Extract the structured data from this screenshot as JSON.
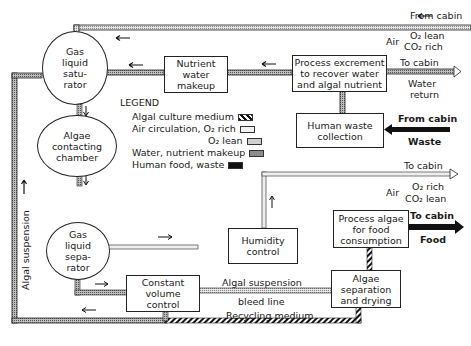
{
  "nodes": {
    "gas_liquid_saturator": "Gas liquid satu- rator",
    "gls_lines": [
      "Gas",
      "liquid",
      "satu-",
      "rator"
    ],
    "algae_contacting_chamber_lines": [
      "Algae",
      "contacting",
      "chamber"
    ],
    "gas_liquid_separator_lines": [
      "Gas",
      "liquid",
      "sepa-",
      "rator"
    ],
    "nutrient_water_makeup_lines": [
      "Nutrient",
      "water",
      "makeup"
    ],
    "process_excrement_lines": [
      "Process excrement",
      "to recover water",
      "and algal nutrient"
    ],
    "human_waste_collection_lines": [
      "Human waste",
      "collection"
    ],
    "humidity_control_lines": [
      "Humidity",
      "control"
    ],
    "process_algae_lines": [
      "Process algae",
      "for food",
      "consumption"
    ],
    "constant_volume_control_lines": [
      "Constant",
      "volume",
      "control"
    ],
    "algae_separation_lines": [
      "Algae",
      "separation",
      "and drying"
    ]
  },
  "labels": {
    "from_cabin_top": "From cabin",
    "air_top": "Air",
    "o2_lean_top": "O₂ lean",
    "co2_rich_top": "CO₂ rich",
    "to_cabin_water": "To cabin",
    "water_return": "Water",
    "water_return_2": "return",
    "from_cabin_waste": "From cabin",
    "waste": "Waste",
    "to_cabin_air": "To cabin",
    "air_mid": "Air",
    "o2_rich_mid": "O₂ rich",
    "co2_lean_mid": "CO₂ lean",
    "to_cabin_food": "To cabin",
    "food": "Food",
    "algal_suspension_side": "Algal suspension",
    "algal_suspension_bleed": "Algal suspension",
    "bleed_line": "bleed line",
    "recycling_medium": "Recycling medium"
  },
  "legend": {
    "title": "LEGEND",
    "items": [
      {
        "label": "Algal culture medium",
        "pattern": "hatched"
      },
      {
        "label": "Air circulation, O₂ rich",
        "pattern": "light"
      },
      {
        "label": "O₂ lean",
        "pattern": "light-dotted"
      },
      {
        "label": "Water, nutrient makeup",
        "pattern": "gray"
      },
      {
        "label": "Human food, waste",
        "pattern": "black"
      }
    ]
  },
  "colors": {
    "line": "#222222",
    "pipe_fill_water": "#9a9a9a",
    "pipe_fill_air": "#d8d8d8",
    "black": "#111111"
  }
}
